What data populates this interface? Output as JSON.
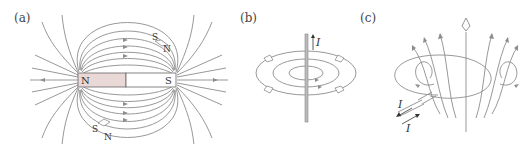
{
  "panels": {
    "a": {
      "label": "(a)",
      "title": "Bar magnet field lines",
      "magnet": {
        "north_label": "N",
        "south_label": "S",
        "north_color": "#ead8d6",
        "south_color": "#ffffff"
      },
      "compass_top": {
        "s": "S",
        "n": "N"
      },
      "compass_bottom": {
        "s": "S",
        "n": "N"
      }
    },
    "b": {
      "label": "(b)",
      "title": "Straight current-carrying wire",
      "current_label": "I"
    },
    "c": {
      "label": "(c)",
      "title": "Current loop",
      "current_in_label": "I",
      "current_out_label": "I"
    }
  },
  "colors": {
    "field_line": "#8c8c8c",
    "text": "#333333",
    "magnet_north": "#ead8d6"
  }
}
